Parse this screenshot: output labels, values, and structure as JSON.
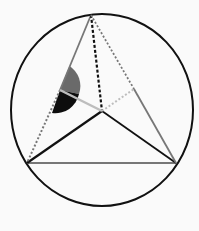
{
  "diagram": {
    "title": "",
    "colors": {
      "background": "#fafafa",
      "circle": "#111111",
      "edge_black": "#111111",
      "edge_gray": "#777777",
      "edge_light": "#bdbdbd",
      "angle_gray": "#6a6a6a",
      "angle_black": "#0d0d0d"
    },
    "circle": {
      "cx": 102,
      "cy": 110,
      "rx": 91,
      "ry": 96
    },
    "points": {
      "apex": [
        91,
        15
      ],
      "left": [
        27,
        163
      ],
      "right": [
        176,
        163
      ],
      "center": [
        102,
        111
      ],
      "edge_mid": [
        60,
        90
      ],
      "right_mid": [
        134,
        89
      ]
    },
    "labels": []
  }
}
